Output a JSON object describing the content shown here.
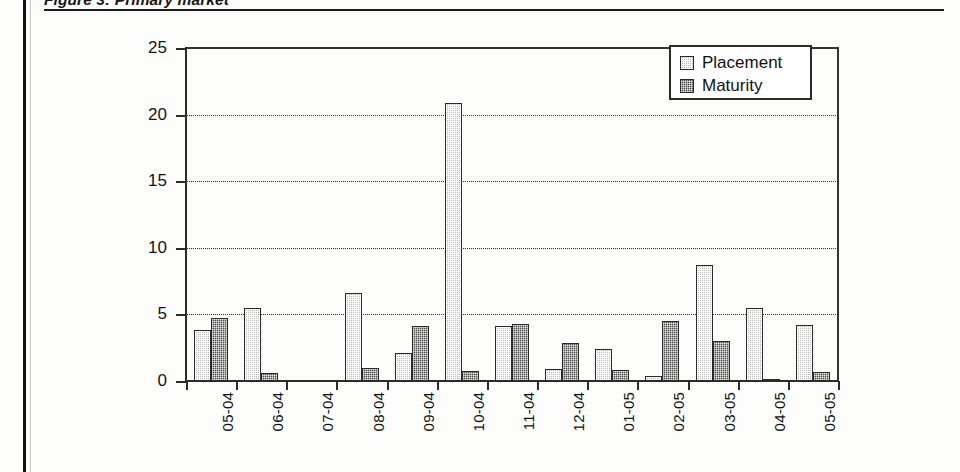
{
  "figure": {
    "caption": "Figure 3: Primary market"
  },
  "legend": {
    "position": "top-right",
    "entries": [
      {
        "label": "Placement",
        "color": "#b6b6b6"
      },
      {
        "label": "Maturity",
        "color": "#4a4a4a"
      }
    ]
  },
  "chart_data": {
    "type": "bar",
    "title": "Figure 3: Primary market",
    "xlabel": "",
    "ylabel": "",
    "ylim": [
      0,
      25
    ],
    "yticks": [
      0,
      5,
      10,
      15,
      20,
      25
    ],
    "grid": true,
    "grid_style": "dotted-horizontal",
    "legend_position": "top-right",
    "categories": [
      "05-04",
      "06-04",
      "07-04",
      "08-04",
      "09-04",
      "10-04",
      "11-04",
      "12-04",
      "01-05",
      "02-05",
      "03-05",
      "04-05",
      "05-05"
    ],
    "series": [
      {
        "name": "Placement",
        "color": "#b6b6b6",
        "values": [
          3.8,
          5.5,
          0,
          6.6,
          2.1,
          20.9,
          4.1,
          0.9,
          2.4,
          0.4,
          8.7,
          5.5,
          4.2
        ]
      },
      {
        "name": "Maturity",
        "color": "#4a4a4a",
        "values": [
          4.7,
          0.6,
          0,
          1.0,
          4.1,
          0.75,
          4.3,
          2.85,
          0.85,
          4.5,
          3.0,
          0.15,
          0.65
        ]
      }
    ]
  }
}
